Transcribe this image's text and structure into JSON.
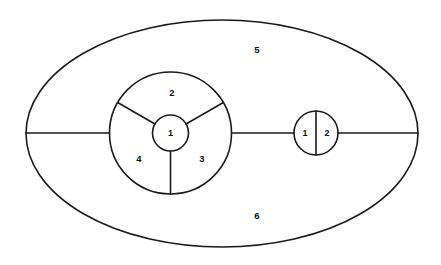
{
  "figure": {
    "background_color": "#ffffff",
    "stroke_color": "#1a1a1a",
    "label_color": "#111111",
    "width": 441,
    "height": 265
  },
  "outer_region": {
    "name": "outer-ellipse",
    "center_x": 222,
    "center_y": 133.5,
    "radius_x": 196,
    "radius_y": 113.5
  },
  "left_disc": {
    "name": "left-big-circle",
    "center_x": 170.5,
    "center_y": 133,
    "radius": 61
  },
  "hub": {
    "name": "left-hub-circle",
    "center_x": 170.5,
    "center_y": 133,
    "radius": 18,
    "label": "1"
  },
  "right_disc": {
    "name": "right-small-circle",
    "center_x": 316,
    "center_y": 133,
    "radius": 22,
    "left_label": "1",
    "right_label": "2"
  },
  "axis_line": {
    "name": "horizontal-axis",
    "y": 133,
    "x_start": 26,
    "x_end": 418
  },
  "spokes": [
    {
      "name": "spoke-down",
      "angle_deg": 90
    },
    {
      "name": "spoke-upper-left",
      "angle_deg": 210
    },
    {
      "name": "spoke-upper-right",
      "angle_deg": 330
    }
  ],
  "labels": {
    "face_2": {
      "text": "2",
      "x": 172,
      "y": 93
    },
    "face_4": {
      "text": "4",
      "x": 139,
      "y": 159
    },
    "face_3": {
      "text": "3",
      "x": 202,
      "y": 159
    },
    "face_5": {
      "text": "5",
      "x": 257,
      "y": 50
    },
    "face_6": {
      "text": "6",
      "x": 257,
      "y": 216
    },
    "hub_1": {
      "text": "1",
      "x": 170.5,
      "y": 134
    },
    "right_1": {
      "text": "1",
      "x": 305,
      "y": 134
    },
    "right_2": {
      "text": "2",
      "x": 327,
      "y": 134
    }
  },
  "chart_data": {
    "type": "diagram",
    "title": "",
    "faces": [
      {
        "id": "1",
        "location": "hub circle at centre of left disc"
      },
      {
        "id": "2",
        "location": "upper sector of left disc"
      },
      {
        "id": "3",
        "location": "lower-right sector of left disc"
      },
      {
        "id": "4",
        "location": "lower-left sector of left disc"
      },
      {
        "id": "5",
        "location": "upper outer region of ellipse"
      },
      {
        "id": "6",
        "location": "lower outer region of ellipse"
      }
    ],
    "right_component_faces": [
      {
        "id": "1",
        "location": "left half of right circle"
      },
      {
        "id": "2",
        "location": "right half of right circle"
      }
    ]
  }
}
